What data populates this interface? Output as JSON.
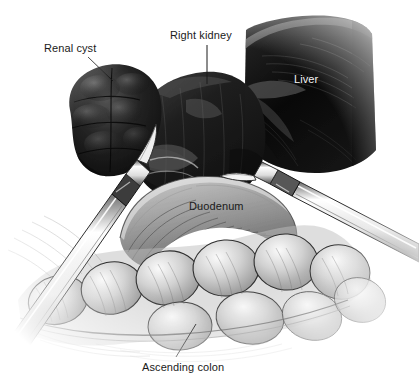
{
  "figure": {
    "background_color": "#ffffff",
    "width": 419,
    "height": 385,
    "style": "grayscale medical line-and-wash illustration"
  },
  "labels": [
    {
      "id": "renal-cyst",
      "text": "Renal cyst",
      "color": "#1a1a1a",
      "x": 44,
      "y": 42,
      "leader": {
        "x1": 88,
        "y1": 57,
        "x2": 113,
        "y2": 81
      }
    },
    {
      "id": "right-kidney",
      "text": "Right kidney",
      "color": "#1a1a1a",
      "x": 170,
      "y": 29,
      "leader": {
        "x1": 207,
        "y1": 45,
        "x2": 207,
        "y2": 84
      }
    },
    {
      "id": "liver",
      "text": "Liver",
      "color": "#f2f2f2",
      "x": 294,
      "y": 73,
      "leader": null
    },
    {
      "id": "duodenum",
      "text": "Duodenum",
      "color": "#1a1a1a",
      "x": 189,
      "y": 200,
      "leader": null
    },
    {
      "id": "ascending-colon",
      "text": "Ascending colon",
      "color": "#1a1a1a",
      "x": 142,
      "y": 361,
      "leader": {
        "x1": 196,
        "y1": 324,
        "x2": 176,
        "y2": 357
      }
    }
  ],
  "anatomy": [
    {
      "id": "renal-cyst",
      "name": "Renal cyst",
      "tone": "very-dark",
      "description": "lobulated bulging dark mass on upper left of kidney"
    },
    {
      "id": "right-kidney",
      "name": "Right kidney",
      "tone": "very-dark",
      "description": "large dark reniform organ across upper center"
    },
    {
      "id": "liver",
      "name": "Liver",
      "tone": "near-black",
      "description": "wedge shaped organ with highlighted superior edge at upper right"
    },
    {
      "id": "duodenum",
      "name": "Duodenum",
      "tone": "mid-gray",
      "description": "C-shaped hatched loop in center"
    },
    {
      "id": "ascending-colon",
      "name": "Ascending colon",
      "tone": "light-gray",
      "description": "haustrated bowel running lower left to right"
    },
    {
      "id": "mesentery",
      "name": "Mesentery / peritoneal fold",
      "tone": "faint-gray",
      "description": "faint sketched tissue at lower left"
    }
  ],
  "instruments": [
    {
      "id": "left-instrument",
      "name": "Laparoscopic grasper",
      "position": "enters from lower left, tip toward kidney",
      "tone": "white-highlight"
    },
    {
      "id": "right-instrument",
      "name": "Laparoscopic dissector",
      "position": "enters from right, tip toward duodenum",
      "tone": "white-highlight"
    }
  ],
  "colors": {
    "background": "#ffffff",
    "ink": "#1a1a1a",
    "label_light": "#f2f2f2",
    "liver_dark": "#0d0d0d",
    "kidney_dark": "#1c1c1c",
    "bowel_light": "#d8d8d8",
    "instrument": "#fbfbfb"
  }
}
